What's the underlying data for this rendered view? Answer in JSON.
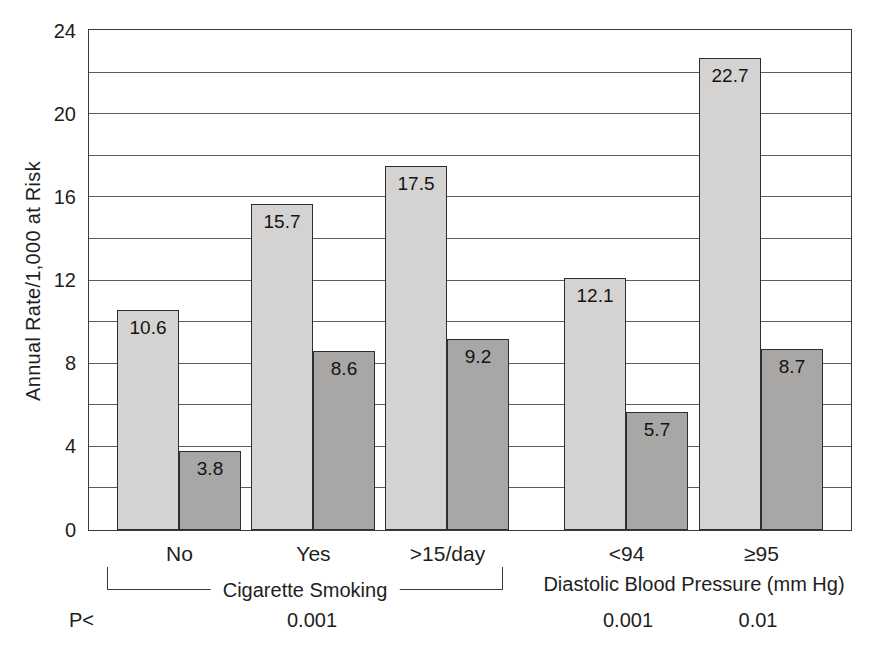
{
  "chart_data": {
    "type": "bar",
    "title": "",
    "ylabel": "Annual Rate/1,000 at Risk",
    "xlabel": "",
    "ylim": [
      0,
      24
    ],
    "yticks": [
      0,
      4,
      8,
      12,
      16,
      20,
      24
    ],
    "gridline_interval": 2,
    "grid": "horizontal",
    "legend": "none",
    "bar_colors": {
      "light": "#d4d3d1",
      "dark": "#a9a7a5"
    },
    "categories": [
      "No",
      "Yes",
      ">15/day",
      "<94",
      "≥95"
    ],
    "series": [
      {
        "name": "light",
        "color": "#d4d3d1",
        "values": [
          10.6,
          15.7,
          17.5,
          12.1,
          22.7
        ]
      },
      {
        "name": "dark",
        "color": "#a9a7a5",
        "values": [
          3.8,
          8.6,
          9.2,
          5.7,
          8.7
        ]
      }
    ],
    "value_labels": [
      "10.6",
      "15.7",
      "17.5",
      "12.1",
      "22.7",
      "3.8",
      "8.6",
      "9.2",
      "5.7",
      "8.7"
    ],
    "sections": [
      {
        "label": "Cigarette Smoking",
        "categories": [
          "No",
          "Yes",
          ">15/day"
        ],
        "bracket": true
      },
      {
        "label": "Diastolic Blood Pressure (mm Hg)",
        "categories": [
          "<94",
          "≥95"
        ],
        "bracket": false
      }
    ],
    "p_row": {
      "label": "P<",
      "values": [
        "0.001",
        "0.001",
        "0.01"
      ]
    }
  }
}
